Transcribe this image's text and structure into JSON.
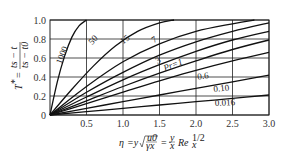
{
  "chart_data": {
    "type": "line",
    "title": "",
    "xlabel": "η = y√(u0/(νx)) = (y/x) Re_x^(1/2)",
    "ylabel": "T* = (ts − t)/(ts − t0)",
    "xlim": [
      0,
      3.0
    ],
    "ylim": [
      0,
      1.0
    ],
    "x_ticks": [
      "0.5",
      "1.0",
      "1.5",
      "2.0",
      "2.5",
      "3.0"
    ],
    "y_ticks": [
      "0",
      "0.2",
      "0.4",
      "0.6",
      "0.8",
      "1.0"
    ],
    "grid": true,
    "series": [
      {
        "name": "1000",
        "label": "1000",
        "points": [
          [
            0,
            0
          ],
          [
            0.1,
            0.35
          ],
          [
            0.2,
            0.62
          ],
          [
            0.3,
            0.82
          ],
          [
            0.4,
            0.94
          ],
          [
            0.5,
            1.0
          ]
        ]
      },
      {
        "name": "50",
        "label": "50",
        "points": [
          [
            0,
            0
          ],
          [
            0.3,
            0.27
          ],
          [
            0.6,
            0.52
          ],
          [
            0.9,
            0.73
          ],
          [
            1.2,
            0.88
          ],
          [
            1.5,
            0.97
          ],
          [
            1.7,
            1.0
          ]
        ]
      },
      {
        "name": "15",
        "label": "15",
        "points": [
          [
            0,
            0
          ],
          [
            0.5,
            0.3
          ],
          [
            1.0,
            0.56
          ],
          [
            1.5,
            0.75
          ],
          [
            2.0,
            0.88
          ],
          [
            2.5,
            0.96
          ],
          [
            2.8,
            1.0
          ]
        ]
      },
      {
        "name": "7",
        "label": "7",
        "points": [
          [
            0,
            0
          ],
          [
            0.5,
            0.24
          ],
          [
            1.0,
            0.45
          ],
          [
            1.5,
            0.63
          ],
          [
            2.0,
            0.77
          ],
          [
            2.5,
            0.88
          ],
          [
            3.0,
            0.97
          ]
        ]
      },
      {
        "name": "3",
        "label": "3",
        "points": [
          [
            0,
            0
          ],
          [
            0.5,
            0.19
          ],
          [
            1.0,
            0.37
          ],
          [
            1.5,
            0.53
          ],
          [
            2.0,
            0.67
          ],
          [
            2.5,
            0.79
          ],
          [
            3.0,
            0.88
          ]
        ]
      },
      {
        "name": "Pr=1",
        "label": "Pr=1",
        "points": [
          [
            0,
            0
          ],
          [
            0.5,
            0.15
          ],
          [
            1.0,
            0.3
          ],
          [
            1.5,
            0.44
          ],
          [
            2.0,
            0.57
          ],
          [
            2.5,
            0.69
          ],
          [
            3.0,
            0.79
          ]
        ]
      },
      {
        "name": "0.6",
        "label": "0.6",
        "points": [
          [
            0,
            0
          ],
          [
            0.5,
            0.12
          ],
          [
            1.0,
            0.24
          ],
          [
            1.5,
            0.36
          ],
          [
            2.0,
            0.47
          ],
          [
            2.5,
            0.57
          ],
          [
            3.0,
            0.66
          ]
        ]
      },
      {
        "name": "0.10",
        "label": "0.10",
        "points": [
          [
            0,
            0
          ],
          [
            0.5,
            0.07
          ],
          [
            1.0,
            0.14
          ],
          [
            1.5,
            0.21
          ],
          [
            2.0,
            0.28
          ],
          [
            2.5,
            0.35
          ],
          [
            3.0,
            0.42
          ]
        ]
      },
      {
        "name": "0.016",
        "label": "0.016",
        "points": [
          [
            0,
            0
          ],
          [
            0.5,
            0.035
          ],
          [
            1.0,
            0.07
          ],
          [
            1.5,
            0.105
          ],
          [
            2.0,
            0.14
          ],
          [
            2.5,
            0.175
          ],
          [
            3.0,
            0.21
          ]
        ]
      }
    ],
    "annotations": [
      {
        "text": "1000",
        "x": 0.2,
        "y": 0.62
      },
      {
        "text": "50",
        "x": 0.62,
        "y": 0.77
      },
      {
        "text": "15",
        "x": 1.05,
        "y": 0.77
      },
      {
        "text": "7",
        "x": 1.45,
        "y": 0.77
      },
      {
        "text": "3",
        "x": 1.5,
        "y": 0.55
      },
      {
        "text": "Pr=1",
        "x": 1.7,
        "y": 0.5
      },
      {
        "text": "0.6",
        "x": 2.1,
        "y": 0.38
      },
      {
        "text": "0.10",
        "x": 2.35,
        "y": 0.25
      },
      {
        "text": "0.016",
        "x": 2.4,
        "y": 0.1
      }
    ]
  },
  "labels": {
    "y_axis_T": "T",
    "y_axis_star": "*",
    "y_axis_eq": "=",
    "y_axis_num": "ts − t",
    "y_axis_den": "ts − t0",
    "x_axis_eta": "η",
    "x_axis_eq1": "=y",
    "x_axis_sqrt_num": "u0",
    "x_axis_sqrt_den": "γx",
    "x_axis_eq2": "=",
    "x_axis_frac_num": "y",
    "x_axis_frac_den": "x",
    "x_axis_re": "Re",
    "x_axis_sub": "x",
    "x_axis_sup": "1/2",
    "origin": "0"
  },
  "colors": {
    "line": "#111111",
    "grid": "#222222",
    "text": "#333333",
    "background": "#ffffff"
  }
}
